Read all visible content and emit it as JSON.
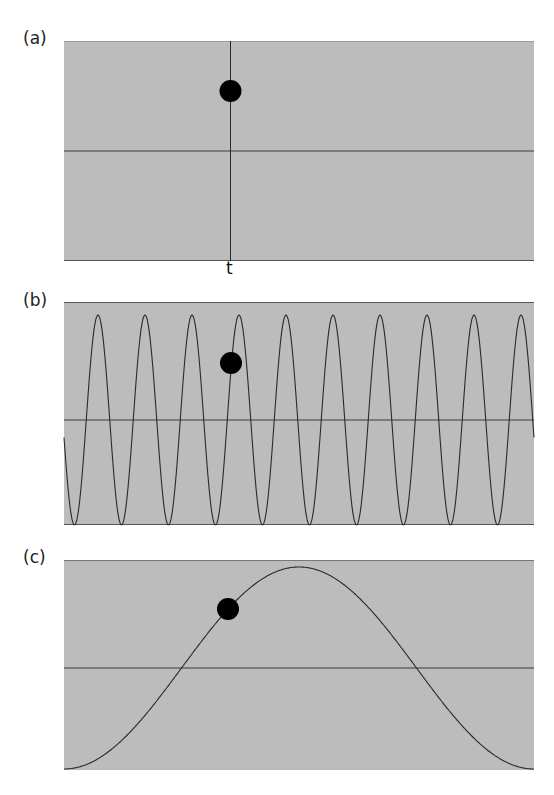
{
  "figure": {
    "panels": [
      {
        "label": "(a)",
        "description": "single impulse at time t with sampled dot"
      },
      {
        "label": "(b)",
        "description": "high-frequency sinusoid sampled at t"
      },
      {
        "label": "(c)",
        "description": "low-frequency sinusoid sampled at t"
      }
    ],
    "time_marker_label": "t",
    "colors": {
      "panel_fill": "#bcbcbc",
      "line": "#3a3a3a",
      "dot": "#000000"
    }
  },
  "chart_data": [
    {
      "type": "line",
      "title": "(a)",
      "description": "vertical line at t, dot above midline",
      "x_marker": "t",
      "dot": {
        "x_frac": 0.355,
        "y_frac": 0.225
      },
      "ylim": [
        -1,
        1
      ]
    },
    {
      "type": "line",
      "title": "(b)",
      "description": "sinusoid with ~10 cycles across panel, dot at t",
      "cycles": 10,
      "amplitude": 0.9,
      "dot": {
        "x_frac": 0.355,
        "y_frac": 0.27
      },
      "ylim": [
        -1,
        1
      ]
    },
    {
      "type": "line",
      "title": "(c)",
      "description": "one full period of inverted cosine (min at both ends, max near center), dot at t",
      "cycles": 1,
      "amplitude": 0.95,
      "dot": {
        "x_frac": 0.349,
        "y_frac": 0.235
      },
      "ylim": [
        -1,
        1
      ]
    }
  ]
}
